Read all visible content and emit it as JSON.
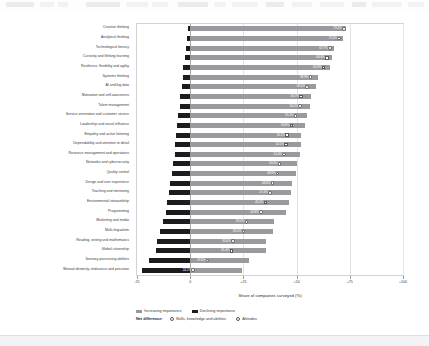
{
  "chart_data": {
    "type": "bar",
    "title": "",
    "xlabel": "Share of companies surveyed (%)",
    "ylabel": "",
    "xlim": [
      -25,
      100
    ],
    "xticks": [
      -25,
      0,
      25,
      50,
      75,
      100
    ],
    "xticklabels": [
      "-25",
      "0",
      "+25",
      "+50",
      "+75",
      "+100"
    ],
    "grid": "vertical",
    "legend_position": "bottom-left",
    "orientation": "horizontal",
    "stacked": "diverging",
    "categories": [
      "Creative thinking",
      "Analytical thinking",
      "Technological literacy",
      "Curiosity and lifelong learning",
      "Resilience, flexibility and agility",
      "Systems thinking",
      "AI and big data",
      "Motivation and self-awareness",
      "Talent management",
      "Service orientation and customer service",
      "Leadership and social influence",
      "Empathy and active listening",
      "Dependability and attention to detail",
      "Resource management and operations",
      "Networks and cybersecurity",
      "Quality control",
      "Design and user experience",
      "Teaching and mentoring",
      "Environmental stewardship",
      "Programming",
      "Marketing and media",
      "Multi-lingualism",
      "Reading, writing and mathematics",
      "Global citizenship",
      "Sensory-processing abilities",
      "Manual dexterity, endurance and precision"
    ],
    "series": [
      {
        "name": "Increasing importance",
        "color": "#9a9a9e",
        "values": [
          73.2,
          71.6,
          67.7,
          66.8,
          65.9,
          59.9,
          59.0,
          56.7,
          56.4,
          55.1,
          53.8,
          52.2,
          52.1,
          51.4,
          50.0,
          49.8,
          48.0,
          47.4,
          46.2,
          44.8,
          39.4,
          39.0,
          35.4,
          35.4,
          27.6,
          24.2
        ],
        "bar_right_ends": [
          73.2,
          71.6,
          67.7,
          66.8,
          65.9,
          59.9,
          59.0,
          56.7,
          56.4,
          55.1,
          53.8,
          52.2,
          52.1,
          51.4,
          50.0,
          49.8,
          48.0,
          47.4,
          46.2,
          44.8,
          39.4,
          39.0,
          35.4,
          35.4,
          27.6,
          24.2
        ]
      },
      {
        "name": "Declining importance",
        "color": "#1c1c1f",
        "values": [
          -1.1,
          -1.6,
          -2.1,
          -2.6,
          -3.2,
          -3.4,
          -4.0,
          -4.6,
          -4.7,
          -5.6,
          -6.2,
          -6.6,
          -7.0,
          -7.3,
          -8.0,
          -8.7,
          -9.3,
          -10.0,
          -10.8,
          -11.6,
          -13.0,
          -14.0,
          -15.4,
          -16.0,
          -19.5,
          -22.8
        ]
      }
    ],
    "net_difference": {
      "label": "Net difference",
      "marker_groups": [
        {
          "name": "Skills, knowledge and abilities",
          "marker": "circle"
        },
        {
          "name": "Attitudes",
          "marker": "square"
        }
      ],
      "point_types": [
        "skills",
        "skills",
        "skills",
        "attitudes",
        "attitudes",
        "skills",
        "skills",
        "attitudes",
        "skills",
        "skills",
        "attitudes",
        "attitudes",
        "attitudes",
        "skills",
        "skills",
        "skills",
        "skills",
        "skills",
        "attitudes",
        "skills",
        "skills",
        "skills",
        "skills",
        "attitudes",
        "skills",
        "skills"
      ],
      "values": [
        72.2,
        70.0,
        65.6,
        64.2,
        62.7,
        56.5,
        55.0,
        52.1,
        51.7,
        49.5,
        47.6,
        45.6,
        45.1,
        44.1,
        42.0,
        41.1,
        38.7,
        37.4,
        35.4,
        33.2,
        26.4,
        25.0,
        20.0,
        19.4,
        8.1,
        1.4
      ],
      "display_labels": [
        "73.2%",
        "71.6%",
        "67.7%",
        "66.8%",
        "65.9%",
        "59.9%",
        "59.0%",
        "56.7%",
        "56.4%",
        "55.1%",
        "53.8%",
        "52.2%",
        "52.1%",
        "51.4%",
        "50.0%",
        "49.8%",
        "48.0%",
        "47.4%",
        "46.2%",
        "44.8%",
        "39.4%",
        "39.0%",
        "35.4%",
        "35.4%",
        "27.6%",
        "24.2%"
      ]
    }
  },
  "axis": {
    "x_title": "Share of companies surveyed (%)"
  },
  "legend": {
    "increasing_label": "Increasing importance",
    "declining_label": "Declining importance",
    "net_prefix": "Net difference:",
    "skills_label": "Skills, knowledge and abilities",
    "attitudes_label": "Attitudes"
  }
}
